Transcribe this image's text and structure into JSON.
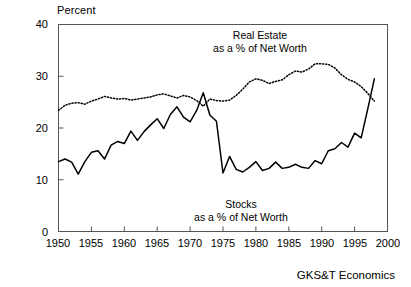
{
  "chart_data": {
    "type": "line",
    "title": "",
    "subtitle": "",
    "xlabel": "",
    "ylabel": "Percent",
    "ylim": [
      0,
      40
    ],
    "xlim": [
      1950,
      2000
    ],
    "yticks": [
      0,
      10,
      20,
      30,
      40
    ],
    "xticks": [
      1950,
      1955,
      1960,
      1965,
      1970,
      1975,
      1980,
      1985,
      1990,
      1995,
      2000
    ],
    "grid": false,
    "legend_position": "inline-annotations",
    "credit": "GKS&T Economics",
    "annotations": [
      {
        "name": "real-estate-annotation",
        "line1": "Real Estate",
        "line2": "as a % of Net Worth",
        "series": "Real Estate as a % of Net Worth"
      },
      {
        "name": "stocks-annotation",
        "line1": "Stocks",
        "line2": "as a % of Net Worth",
        "series": "Stocks as a % of Net Worth"
      }
    ],
    "x": [
      1950,
      1951,
      1952,
      1953,
      1954,
      1955,
      1956,
      1957,
      1958,
      1959,
      1960,
      1961,
      1962,
      1963,
      1964,
      1965,
      1966,
      1967,
      1968,
      1969,
      1970,
      1971,
      1972,
      1973,
      1974,
      1975,
      1976,
      1977,
      1978,
      1979,
      1980,
      1981,
      1982,
      1983,
      1984,
      1985,
      1986,
      1987,
      1988,
      1989,
      1990,
      1991,
      1992,
      1993,
      1994,
      1995,
      1996,
      1997,
      1998
    ],
    "series": [
      {
        "name": "Real Estate as a % of Net Worth",
        "style": "dotted",
        "color": "#000000",
        "values": [
          23.4,
          24.4,
          24.8,
          24.9,
          24.6,
          25.2,
          25.6,
          26.1,
          25.8,
          25.6,
          25.7,
          25.4,
          25.6,
          25.8,
          26.0,
          26.4,
          26.6,
          26.2,
          25.8,
          26.3,
          26.0,
          25.3,
          24.2,
          25.6,
          25.3,
          25.2,
          25.4,
          26.3,
          27.5,
          28.9,
          29.5,
          29.2,
          28.6,
          29.0,
          29.3,
          30.3,
          31.0,
          30.8,
          31.4,
          32.4,
          32.4,
          32.3,
          31.6,
          30.3,
          29.4,
          28.9,
          28.0,
          26.7,
          25.2
        ]
      },
      {
        "name": "Stocks as a % of Net Worth",
        "style": "solid",
        "color": "#000000",
        "values": [
          13.5,
          14.0,
          13.4,
          11.1,
          13.5,
          15.3,
          15.6,
          14.0,
          16.7,
          17.4,
          17.0,
          19.4,
          17.6,
          19.3,
          20.6,
          21.8,
          19.9,
          22.6,
          24.1,
          22.1,
          21.2,
          23.4,
          26.8,
          22.5,
          21.3,
          11.3,
          14.5,
          12.0,
          11.5,
          12.4,
          13.5,
          11.8,
          12.2,
          13.4,
          12.2,
          12.4,
          13.0,
          12.4,
          12.2,
          13.7,
          13.1,
          15.6,
          16.0,
          17.2,
          16.3,
          19.0,
          18.1,
          23.7,
          29.5
        ]
      }
    ]
  }
}
